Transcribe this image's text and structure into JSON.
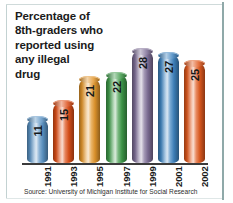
{
  "chart_data": {
    "type": "bar",
    "title": "Percentage of\n8th-graders who\nreported using\nany illegal\ndrug",
    "categories": [
      "1991",
      "1993",
      "1995",
      "1997",
      "1999",
      "2001",
      "2002"
    ],
    "values": [
      11,
      15,
      21,
      22,
      28,
      27,
      25
    ],
    "value_labels": [
      "11",
      "15",
      "21",
      "22",
      "28",
      "27",
      "25"
    ],
    "series": [
      {
        "name": "Percentage of 8th-graders reporting any illegal drug use",
        "values": [
          11,
          15,
          21,
          22,
          28,
          27,
          25
        ]
      }
    ],
    "xlabel": "",
    "ylabel": "",
    "ylim": [
      0,
      30
    ],
    "grid": false,
    "legend": false,
    "units": "percent",
    "bar_colors": [
      "#5b93c4",
      "#dd4f18",
      "#e3962c",
      "#3f9a4a",
      "#7e6e96",
      "#3f84c0",
      "#e0591e"
    ],
    "source": "Source: University of Michigan Institute for Social Research"
  },
  "colors": {
    "axis": "#3b3b3b",
    "title_text": "#1b1b1b",
    "value_text": "#14171a",
    "source_text": "#2c2c2c",
    "background": "#ffffff",
    "frame": "#9fb5b5"
  }
}
